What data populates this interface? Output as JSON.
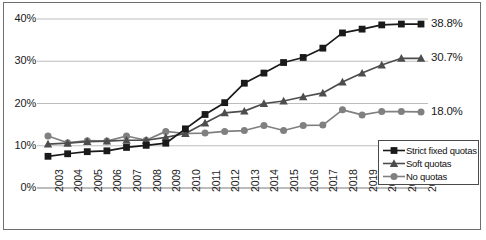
{
  "chart_data": {
    "type": "line",
    "title": "",
    "subtitle": "",
    "xlabel": "",
    "ylabel": "",
    "grid": true,
    "legend_position": "inside-bottom-right",
    "ylim": [
      0,
      45
    ],
    "ytick_labels": [
      "0%",
      "10%",
      "20%",
      "30%",
      "40%"
    ],
    "ytick_values": [
      0,
      10,
      20,
      30,
      40
    ],
    "categories": [
      "2003",
      "2004",
      "2005",
      "2006",
      "2007",
      "2008",
      "2009",
      "2010",
      "2011",
      "2012",
      "2013",
      "2014",
      "2015",
      "2016",
      "2017",
      "2018",
      "2019",
      "2020",
      "2021",
      "2022"
    ],
    "series": [
      {
        "name": "Strict fixed quotas",
        "marker": "square",
        "color": "#1a1a1a",
        "values": [
          7.5,
          8.1,
          8.6,
          8.8,
          9.6,
          10.1,
          10.6,
          14.0,
          17.4,
          20.2,
          24.8,
          27.2,
          29.7,
          30.9,
          33.1,
          36.7,
          37.6,
          38.6,
          38.8,
          38.8
        ],
        "end_label": "38.8%"
      },
      {
        "name": "Soft quotas",
        "marker": "triangle",
        "color": "#4d4d4d",
        "values": [
          10.4,
          10.6,
          11.0,
          11.1,
          11.3,
          11.3,
          12.0,
          12.9,
          15.4,
          17.8,
          18.2,
          20.0,
          20.6,
          21.6,
          22.5,
          25.1,
          27.2,
          29.1,
          30.7,
          30.7
        ],
        "end_label": "30.7%"
      },
      {
        "name": "No quotas",
        "marker": "circle",
        "color": "#808080",
        "values": [
          12.3,
          10.7,
          11.2,
          11.1,
          12.3,
          11.3,
          13.4,
          12.9,
          13.0,
          13.4,
          13.6,
          14.8,
          13.6,
          14.8,
          14.9,
          18.5,
          17.3,
          18.1,
          18.1,
          18.0
        ],
        "end_label": "18.0%"
      }
    ]
  },
  "legend": {
    "items": [
      {
        "label": "Strict fixed quotas"
      },
      {
        "label": "Soft quotas"
      },
      {
        "label": "No quotas"
      }
    ]
  }
}
